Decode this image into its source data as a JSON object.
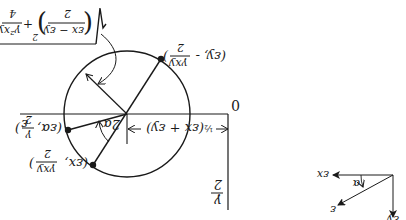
{
  "diagram": {
    "orientation_deg": 180,
    "mohr_circle": {
      "axis_label_epsilon": "ε",
      "origin_label": "0",
      "gamma_axis_label_num": "γ",
      "gamma_axis_label_den": "2",
      "center_label": "½(εx + εy)",
      "center_label_half": "½",
      "center_label_expr": "(εx + εy)",
      "radius_label": {
        "sqrt": "√",
        "term1_num": "εx − εy",
        "term1_den": "2",
        "exp": "2",
        "plus": "+",
        "term2_num": "γ²xy",
        "term2_den": "4"
      },
      "angle_label": "2α",
      "points": [
        {
          "name": "point-x",
          "label_a": "(εx,",
          "label_num": "γxy",
          "label_den": "2",
          "label_close": ")"
        },
        {
          "name": "point-general",
          "label_a": "(εα,",
          "label_num": "γ",
          "label_den": "2",
          "label_close": ")"
        },
        {
          "name": "point-y",
          "label_a": "(εy, -",
          "label_num": "γxy",
          "label_den": "2",
          "label_close": ")"
        }
      ]
    },
    "axes_diagram": {
      "x_label": "εx",
      "y_label": "εy",
      "rotated_label": "ε",
      "angle_label": "α"
    },
    "colors": {
      "ink": "#1a1a1a",
      "background": "#ffffff"
    }
  }
}
